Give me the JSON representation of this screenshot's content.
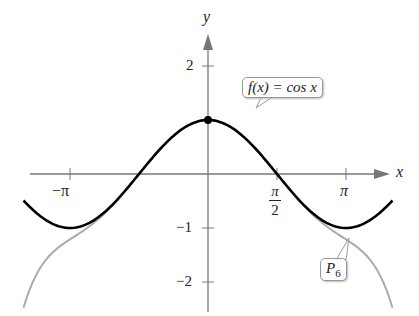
{
  "chart_data": {
    "type": "line",
    "title": "",
    "xlabel": "x",
    "ylabel": "y",
    "xlim": [
      -4.3,
      4.6
    ],
    "ylim": [
      -2.5,
      2.5
    ],
    "x_ticks": [
      "-π",
      "π/2",
      "π"
    ],
    "y_ticks": [
      "2",
      "-1",
      "-2"
    ],
    "series": [
      {
        "name": "f(x) = cos x",
        "color": "#000000",
        "function": "cos(x)",
        "range": [
          -4.2,
          4.2
        ]
      },
      {
        "name": "P6",
        "color": "#aaaaaa",
        "function": "1 - x^2/2 + x^4/24 - x^6/720",
        "range": [
          -4.2,
          4.2
        ]
      }
    ],
    "points": [
      {
        "x": 0,
        "y": 1,
        "label": "(0,1)"
      }
    ],
    "annotations": [
      "f(x) = cos x",
      "P6"
    ]
  },
  "labels": {
    "y_axis": "y",
    "x_axis": "x",
    "tick_2": "2",
    "tick_m1": "−1",
    "tick_m2": "−2",
    "tick_mpi": "−π",
    "tick_pi": "π",
    "tick_pi2_num": "π",
    "tick_pi2_den": "2",
    "callout_f": "f(x) = cos x",
    "callout_p": "P",
    "callout_p_sub": "6"
  }
}
